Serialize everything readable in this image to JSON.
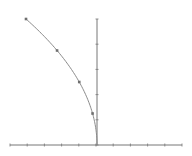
{
  "chart_data": {
    "type": "line",
    "title": "",
    "xlabel": "",
    "ylabel": "",
    "function": "y = sqrt(-x)",
    "series": [
      {
        "name": "curve",
        "x": [
          -16,
          -9,
          -4,
          -1,
          0
        ],
        "y": [
          4,
          3,
          2,
          1,
          0
        ],
        "markers": [
          [
            -16,
            4
          ],
          [
            -9,
            3
          ],
          [
            -4,
            2
          ],
          [
            -1,
            1
          ]
        ]
      }
    ],
    "xlim": [
      -19.5,
      19.5
    ],
    "ylim": [
      0,
      4
    ],
    "x_ticks_count": 11,
    "y_ticks_count": 6,
    "tick_labels": false,
    "grid": false,
    "legend": "none",
    "colors": {
      "axis": "#777777",
      "curve": "#8a8a8a",
      "marker": "#6f6f6f",
      "background": "#ffffff"
    }
  }
}
